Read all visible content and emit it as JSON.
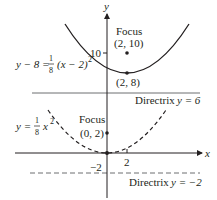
{
  "axes": {
    "x_label": "x",
    "y_label": "y",
    "x_tick": "2",
    "y_tick_top": "10",
    "y_tick_bottom": "−2"
  },
  "upper_parabola": {
    "equation_lhs": "y − 8 =",
    "equation_frac_num": "1",
    "equation_frac_den": "8",
    "equation_rhs": "(x − 2)",
    "equation_exp": "2",
    "focus_label": "Focus",
    "focus_coords": "(2, 10)",
    "vertex_coords": "(2, 8)",
    "directrix_label": "Directrix",
    "directrix_eq": "y = 6",
    "style": "solid"
  },
  "lower_parabola": {
    "equation_lhs": "y =",
    "equation_frac_num": "1",
    "equation_frac_den": "8",
    "equation_rhs": "x",
    "equation_exp": "2",
    "focus_label": "Focus",
    "focus_coords": "(0, 2)",
    "directrix_label": "Directrix",
    "directrix_eq": "y = −2",
    "style": "dashed"
  },
  "colors": {
    "ink": "#231f20",
    "axis": "#231f20",
    "directrix": "#6d6e71"
  }
}
